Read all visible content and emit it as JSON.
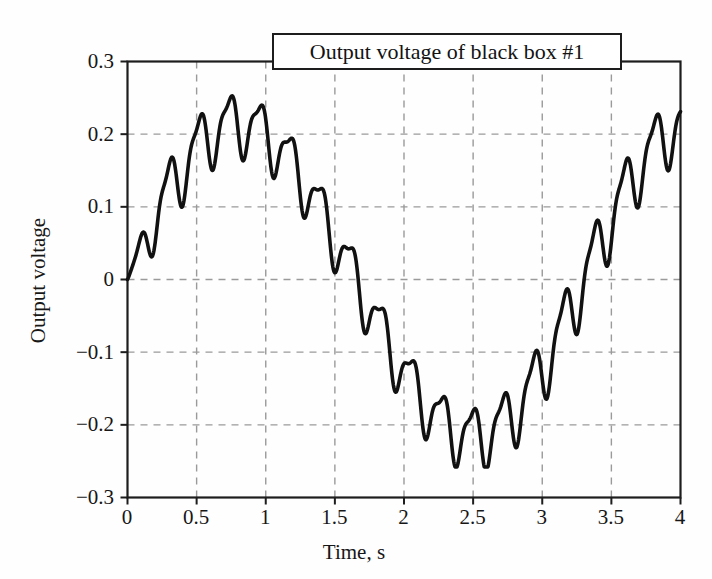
{
  "figure": {
    "background_color": "#fefefe",
    "axis_color": "#1d1d1d",
    "grid_color": "#9a9a9a",
    "line_color": "#111111"
  },
  "chart_data": {
    "type": "line",
    "title": "Output voltage of black box #1",
    "xlabel": "Time, s",
    "ylabel": "Output voltage",
    "xlim": [
      0,
      4
    ],
    "ylim": [
      -0.3,
      0.3
    ],
    "grid": true,
    "grid_style": "dashed",
    "legend": null,
    "legend_position": "none",
    "xticks": [
      0,
      0.5,
      1,
      1.5,
      2,
      2.5,
      3,
      3.5,
      4
    ],
    "xtick_labels": [
      "0",
      "0.5",
      "1",
      "1.5",
      "2",
      "2.5",
      "3",
      "3.5",
      "4"
    ],
    "yticks": [
      -0.3,
      -0.2,
      -0.1,
      0,
      0.1,
      0.2,
      0.3
    ],
    "ytick_labels": [
      "−0.3",
      "−0.2",
      "−0.1",
      "0",
      "0.1",
      "0.2",
      "0.3"
    ],
    "series": [
      {
        "name": "Output voltage",
        "x": [
          0.0,
          0.05,
          0.1,
          0.15,
          0.2,
          0.25,
          0.3,
          0.35,
          0.4,
          0.45,
          0.5,
          0.55,
          0.6,
          0.65,
          0.7,
          0.75,
          0.8,
          0.85,
          0.9,
          0.95,
          1.0,
          1.05,
          1.1,
          1.15,
          1.2,
          1.25,
          1.3,
          1.35,
          1.4,
          1.45,
          1.5,
          1.55,
          1.6,
          1.65,
          1.7,
          1.75,
          1.8,
          1.85,
          1.9,
          1.95,
          2.0,
          2.05,
          2.1,
          2.15,
          2.2,
          2.25,
          2.3,
          2.35,
          2.4,
          2.45,
          2.5,
          2.55,
          2.6,
          2.65,
          2.7,
          2.75,
          2.8,
          2.85,
          2.9,
          2.95,
          3.0,
          3.05,
          3.1,
          3.15,
          3.2,
          3.25,
          3.3,
          3.35,
          3.4,
          3.45,
          3.5,
          3.55,
          3.6,
          3.65,
          3.7,
          3.75,
          3.8,
          3.85,
          3.9,
          3.95,
          4.0
        ],
        "y": [
          0.0,
          0.01,
          0.03,
          0.06,
          0.09,
          0.112,
          0.117,
          0.118,
          0.13,
          0.16,
          0.193,
          0.205,
          0.2,
          0.196,
          0.205,
          0.228,
          0.248,
          0.256,
          0.25,
          0.236,
          0.224,
          0.222,
          0.232,
          0.245,
          0.25,
          0.244,
          0.228,
          0.205,
          0.19,
          0.186,
          0.188,
          0.18,
          0.158,
          0.125,
          0.1,
          0.098,
          0.097,
          0.085,
          0.06,
          0.03,
          0.0,
          -0.03,
          -0.06,
          -0.08,
          -0.09,
          -0.092,
          -0.098,
          -0.118,
          -0.145,
          -0.17,
          -0.186,
          -0.192,
          -0.196,
          -0.208,
          -0.216,
          -0.212,
          -0.206,
          -0.208,
          -0.222,
          -0.24,
          -0.252,
          -0.258,
          -0.253,
          -0.24,
          -0.228,
          -0.222,
          -0.226,
          -0.234,
          -0.238,
          -0.232,
          -0.218,
          -0.196,
          -0.172,
          -0.152,
          -0.14,
          -0.138,
          -0.14,
          -0.132,
          -0.112,
          -0.085,
          -0.06
        ],
        "note_segment": "first half, 0 to 4 s sampled coarsely; full detailed path rendered by generator"
      }
    ],
    "key_points": {
      "start": {
        "t": 0.0,
        "v": 0.0
      },
      "shelf_rise_1": {
        "t": 0.27,
        "v": 0.117
      },
      "peak_1": {
        "t": 0.52,
        "v": 0.206
      },
      "dip_1": {
        "t": 0.63,
        "v": 0.196
      },
      "peak_2": {
        "t": 0.7,
        "v": 0.256
      },
      "dip_2": {
        "t": 0.82,
        "v": 0.222
      },
      "peak_3": {
        "t": 0.91,
        "v": 0.249
      },
      "shelf_fall_1": {
        "t": 1.18,
        "v": 0.188
      },
      "shelf_fall_2": {
        "t": 1.37,
        "v": 0.098
      },
      "zero_crossing_down": {
        "t": 1.62,
        "v": 0.0
      },
      "shelf_fall_3": {
        "t": 1.82,
        "v": -0.092
      },
      "shelf_fall_4": {
        "t": 2.05,
        "v": -0.215
      },
      "bump_1": {
        "t": 2.16,
        "v": -0.206
      },
      "min_global": {
        "t": 2.33,
        "v": -0.258
      },
      "bump_2": {
        "t": 2.5,
        "v": -0.222
      },
      "dip_3": {
        "t": 2.6,
        "v": -0.238
      },
      "shelf_rise_2": {
        "t": 2.86,
        "v": -0.139
      },
      "zero_crossing_up": {
        "t": 3.12,
        "v": 0.0
      },
      "shelf_rise_3": {
        "t": 3.32,
        "v": 0.097
      },
      "shelf_rise_4": {
        "t": 3.56,
        "v": 0.188
      },
      "peak_4": {
        "t": 3.72,
        "v": 0.236
      },
      "dip_4": {
        "t": 3.8,
        "v": 0.214
      },
      "peak_5": {
        "t": 3.93,
        "v": 0.257
      },
      "end": {
        "t": 4.0,
        "v": 0.247
      }
    }
  }
}
